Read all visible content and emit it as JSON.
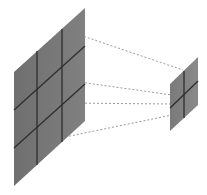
{
  "diagram": {
    "input_panel": {
      "rows": 3,
      "cols": 3,
      "fill": "#7b7b7b",
      "grid_color": "#2e2e2e"
    },
    "output_panel": {
      "rows": 2,
      "cols": 2,
      "fill": "#7b7b7b",
      "grid_color": "#2e2e2e"
    },
    "connector_style": {
      "color": "#9a9a9a",
      "dashed": true,
      "count": 4
    }
  }
}
